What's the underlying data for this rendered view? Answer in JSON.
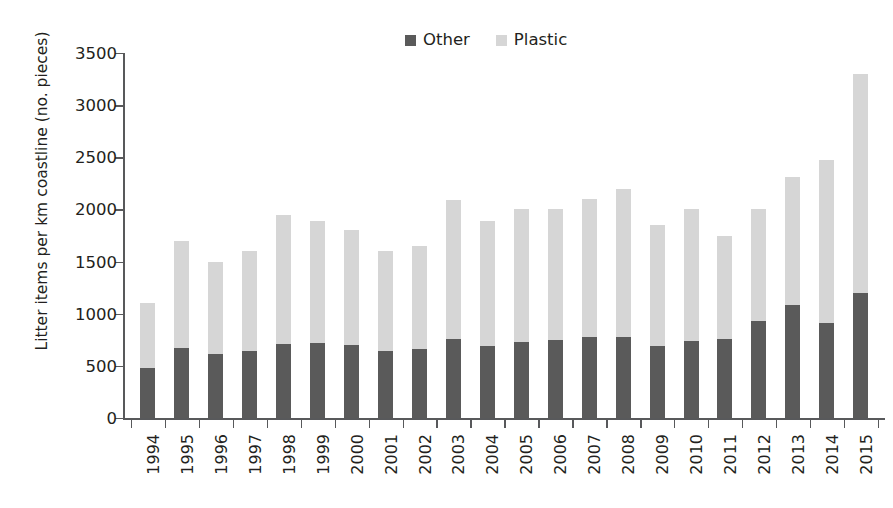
{
  "chart_data": {
    "type": "bar",
    "subtype": "stacked-bar",
    "title": "",
    "xlabel": "",
    "ylabel": "Litter items per km coastline (no. pieces)",
    "ylim": [
      0,
      3500
    ],
    "ytick_step": 500,
    "yticks": [
      0,
      500,
      1000,
      1500,
      2000,
      2500,
      3000,
      3500
    ],
    "ytick_labels": [
      "0",
      "500",
      "1000",
      "1500",
      "2000",
      "2500",
      "3000",
      "3500"
    ],
    "grid": false,
    "legend_position": "top-center",
    "categories": [
      "1994",
      "1995",
      "1996",
      "1997",
      "1998",
      "1999",
      "2000",
      "2001",
      "2002",
      "2003",
      "2004",
      "2005",
      "2006",
      "2007",
      "2008",
      "2009",
      "2010",
      "2011",
      "2012",
      "2013",
      "2014",
      "2015"
    ],
    "series": [
      {
        "name": "Other",
        "color": "#5a5a5a",
        "values": [
          480,
          670,
          610,
          640,
          710,
          720,
          700,
          640,
          660,
          760,
          690,
          730,
          750,
          780,
          780,
          690,
          735,
          755,
          930,
          1080,
          915,
          1200
        ]
      },
      {
        "name": "Plastic",
        "color": "#d6d6d6",
        "values": [
          620,
          1030,
          890,
          960,
          1240,
          1170,
          1100,
          960,
          990,
          1330,
          1200,
          1270,
          1250,
          1320,
          1420,
          1160,
          1265,
          995,
          1070,
          1230,
          1555,
          2100
        ]
      }
    ],
    "totals": [
      1100,
      1700,
      1500,
      1600,
      1950,
      1890,
      1800,
      1600,
      1650,
      2090,
      1890,
      2000,
      2000,
      2100,
      2200,
      1850,
      2000,
      1750,
      2000,
      2310,
      2470,
      3300
    ]
  },
  "legend": {
    "entries": [
      {
        "label": "Other",
        "color": "#5a5a5a"
      },
      {
        "label": "Plastic",
        "color": "#d6d6d6"
      }
    ]
  },
  "axes": {
    "y_title": "Litter items per km coastline (no. pieces)",
    "axis_color": "#58595b"
  }
}
